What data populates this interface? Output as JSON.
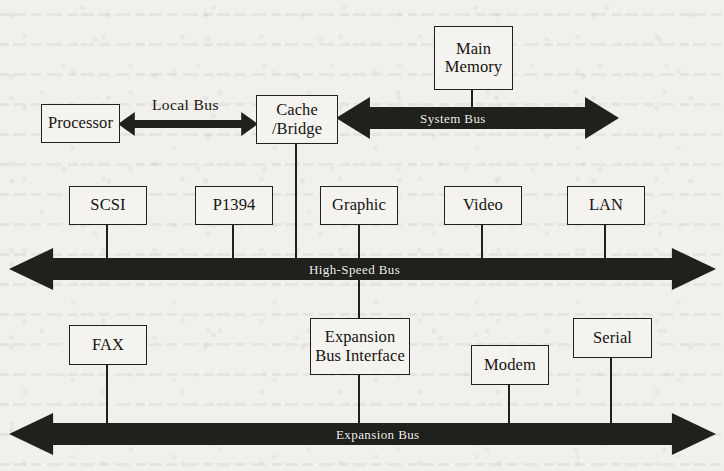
{
  "figure": {
    "background_color": "#f1f0ed",
    "ink_color": "#20201c",
    "bus_label_color": "#f3f2ef"
  },
  "nodes": [
    {
      "id": "processor",
      "label": "Processor",
      "x": 41,
      "y": 104,
      "w": 79,
      "h": 39
    },
    {
      "id": "cache-bridge",
      "label": "Cache\n/Bridge",
      "x": 256,
      "y": 95,
      "w": 82,
      "h": 49
    },
    {
      "id": "main-memory",
      "label": "Main\nMemory",
      "x": 434,
      "y": 26,
      "w": 79,
      "h": 64
    },
    {
      "id": "scsi",
      "label": "SCSI",
      "x": 69,
      "y": 186,
      "w": 78,
      "h": 39
    },
    {
      "id": "p1394",
      "label": "P1394",
      "x": 195,
      "y": 186,
      "w": 78,
      "h": 39
    },
    {
      "id": "graphic",
      "label": "Graphic",
      "x": 320,
      "y": 186,
      "w": 78,
      "h": 39
    },
    {
      "id": "video",
      "label": "Video",
      "x": 444,
      "y": 186,
      "w": 78,
      "h": 39
    },
    {
      "id": "lan",
      "label": "LAN",
      "x": 567,
      "y": 186,
      "w": 78,
      "h": 39
    },
    {
      "id": "fax",
      "label": "FAX",
      "x": 69,
      "y": 325,
      "w": 78,
      "h": 40
    },
    {
      "id": "expansion-bus-interface",
      "label": "Expansion\nBus Interface",
      "x": 310,
      "y": 318,
      "w": 100,
      "h": 57
    },
    {
      "id": "modem",
      "label": "Modem",
      "x": 471,
      "y": 345,
      "w": 78,
      "h": 40
    },
    {
      "id": "serial",
      "label": "Serial",
      "x": 573,
      "y": 318,
      "w": 79,
      "h": 40
    }
  ],
  "buses": [
    {
      "id": "local-bus",
      "label": "Local Bus",
      "label_position": "above",
      "x": 118,
      "y": 112,
      "w": 140,
      "h": 24,
      "label_x": 152,
      "label_y": 96
    },
    {
      "id": "system-bus",
      "label": "System Bus",
      "label_position": "inside",
      "x": 336,
      "y": 97,
      "w": 283,
      "h": 42,
      "label_x": 420,
      "label_y": 111
    },
    {
      "id": "high-speed-bus",
      "label": "High-Speed Bus",
      "label_position": "inside",
      "x": 9,
      "y": 248,
      "w": 707,
      "h": 42,
      "label_x": 309,
      "label_y": 262
    },
    {
      "id": "expansion-bus",
      "label": "Expansion Bus",
      "label_position": "inside",
      "x": 9,
      "y": 413,
      "w": 707,
      "h": 42,
      "label_x": 336,
      "label_y": 427
    }
  ],
  "connectors": [
    {
      "id": "main-memory-to-system-bus",
      "x": 472,
      "y": 89,
      "h": 30
    },
    {
      "id": "cache-bridge-to-high-speed",
      "x": 296,
      "y": 143,
      "h": 126
    },
    {
      "id": "scsi-to-high-speed",
      "x": 107,
      "y": 224,
      "h": 45
    },
    {
      "id": "p1394-to-high-speed",
      "x": 233,
      "y": 224,
      "h": 45
    },
    {
      "id": "graphic-to-high-speed",
      "x": 359,
      "y": 224,
      "h": 45
    },
    {
      "id": "video-to-high-speed",
      "x": 482,
      "y": 224,
      "h": 45
    },
    {
      "id": "lan-to-high-speed",
      "x": 605,
      "y": 224,
      "h": 45
    },
    {
      "id": "high-speed-to-expansion-bus-interface",
      "x": 359,
      "y": 268,
      "h": 52
    },
    {
      "id": "expansion-bus-interface-to-expansion-bus",
      "x": 359,
      "y": 374,
      "h": 60
    },
    {
      "id": "fax-to-expansion-bus",
      "x": 107,
      "y": 364,
      "h": 70
    },
    {
      "id": "modem-to-expansion-bus",
      "x": 509,
      "y": 384,
      "h": 50
    },
    {
      "id": "serial-to-expansion-bus",
      "x": 611,
      "y": 357,
      "h": 77
    }
  ]
}
